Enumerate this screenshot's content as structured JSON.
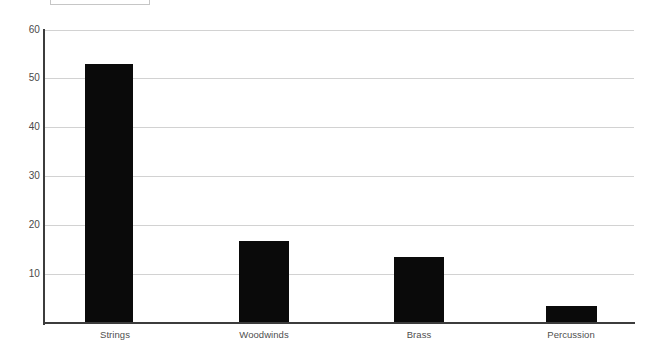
{
  "legend_box": {
    "present": true,
    "label": ""
  },
  "colors": {
    "bar": "#0a0a0a",
    "gridline": "#d2d2d2",
    "axis": "#3c3c3c",
    "tick_text": "#4a4a4a",
    "category_text": "#4f4f4f",
    "background": "#ffffff"
  },
  "axis": {
    "y_ticks": [
      "10",
      "20",
      "30",
      "40",
      "50",
      "60"
    ],
    "x_ticks": [
      "Strings",
      "Woodwinds",
      "Brass",
      "Percussion"
    ]
  },
  "chart_data": {
    "type": "bar",
    "title": "",
    "subtitle": "",
    "xlabel": "",
    "ylabel": "",
    "categories": [
      "Strings",
      "Woodwinds",
      "Brass",
      "Percussion"
    ],
    "values": [
      53,
      16.7,
      13.5,
      3.5
    ],
    "ylim": [
      0,
      60
    ],
    "yticks": [
      0,
      10,
      20,
      30,
      40,
      50,
      60
    ],
    "ytick_labels": [
      "",
      "10",
      "20",
      "30",
      "40",
      "50",
      "60"
    ],
    "grid": true,
    "grid_axis": "y",
    "legend": false,
    "legend_position": "none",
    "bar_color": "#0a0a0a",
    "annotations": []
  }
}
